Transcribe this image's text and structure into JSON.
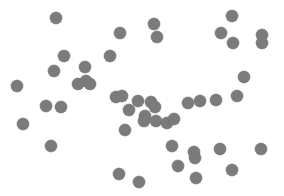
{
  "chart_data": {
    "type": "scatter",
    "title": "",
    "xlabel": "",
    "ylabel": "",
    "grid": false,
    "legend": null,
    "axes_visible": false,
    "marker_color": "#7b7b7b",
    "marker_diameter_px": 12,
    "xlim": [
      0,
      284
    ],
    "ylim": [
      0,
      196
    ],
    "points": [
      {
        "x": 56,
        "y": 18
      },
      {
        "x": 154,
        "y": 24
      },
      {
        "x": 232,
        "y": 16
      },
      {
        "x": 120,
        "y": 33
      },
      {
        "x": 157,
        "y": 37
      },
      {
        "x": 221,
        "y": 33
      },
      {
        "x": 233,
        "y": 43
      },
      {
        "x": 262,
        "y": 35
      },
      {
        "x": 262,
        "y": 43
      },
      {
        "x": 64,
        "y": 56
      },
      {
        "x": 110,
        "y": 56
      },
      {
        "x": 54,
        "y": 71
      },
      {
        "x": 85,
        "y": 67
      },
      {
        "x": 244,
        "y": 77
      },
      {
        "x": 17,
        "y": 86
      },
      {
        "x": 78,
        "y": 84
      },
      {
        "x": 86,
        "y": 81
      },
      {
        "x": 90,
        "y": 84
      },
      {
        "x": 237,
        "y": 96
      },
      {
        "x": 116,
        "y": 97
      },
      {
        "x": 122,
        "y": 96
      },
      {
        "x": 138,
        "y": 101
      },
      {
        "x": 151,
        "y": 102
      },
      {
        "x": 155,
        "y": 107
      },
      {
        "x": 188,
        "y": 103
      },
      {
        "x": 200,
        "y": 101
      },
      {
        "x": 216,
        "y": 100
      },
      {
        "x": 46,
        "y": 106
      },
      {
        "x": 61,
        "y": 107
      },
      {
        "x": 129,
        "y": 110
      },
      {
        "x": 145,
        "y": 116
      },
      {
        "x": 144,
        "y": 121
      },
      {
        "x": 156,
        "y": 121
      },
      {
        "x": 167,
        "y": 123
      },
      {
        "x": 174,
        "y": 119
      },
      {
        "x": 23,
        "y": 124
      },
      {
        "x": 125,
        "y": 130
      },
      {
        "x": 51,
        "y": 146
      },
      {
        "x": 172,
        "y": 146
      },
      {
        "x": 194,
        "y": 152
      },
      {
        "x": 195,
        "y": 158
      },
      {
        "x": 220,
        "y": 149
      },
      {
        "x": 261,
        "y": 149
      },
      {
        "x": 178,
        "y": 166
      },
      {
        "x": 232,
        "y": 170
      },
      {
        "x": 119,
        "y": 174
      },
      {
        "x": 196,
        "y": 178
      },
      {
        "x": 139,
        "y": 182
      }
    ]
  }
}
